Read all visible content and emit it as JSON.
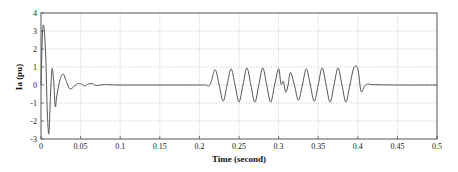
{
  "chart_data": {
    "type": "line",
    "title": "",
    "xlabel": "Time (second)",
    "ylabel": "Ia (pu)",
    "xlim": [
      0,
      0.5
    ],
    "ylim": [
      -3,
      4
    ],
    "grid": true,
    "legend": null,
    "x_ticks": [
      "0",
      "0.05",
      "0.1",
      "0.15",
      "0.2",
      "0.25",
      "0.3",
      "0.35",
      "0.4",
      "0.45",
      "0.5"
    ],
    "y_ticks": [
      "4",
      "3",
      "2",
      "1",
      "0",
      "-1",
      "-2",
      "-3"
    ],
    "series": [
      {
        "name": "Ia",
        "color": "#555555",
        "description": "Initial transient: rises to ~3.1 pu, dips to ~-2.7 pu at t~0.008, damped oscillation (peaks ~0.9, -1.2, 0.6, -0.2) settling near 0 by t~0.05; near-zero from 0.05 to 0.21; sustained ~50 Hz oscillation of amplitude ~0.9-1.0 pu from t~0.21 to t~0.40 with a disturbance dip near t~0.305; returns to ~0 after t~0.40 with small overshoot.",
        "x": [
          0,
          0.002,
          0.004,
          0.006,
          0.008,
          0.01,
          0.012,
          0.014,
          0.016,
          0.018,
          0.02,
          0.024,
          0.028,
          0.032,
          0.036,
          0.04,
          0.045,
          0.05,
          0.055,
          0.06,
          0.065,
          0.07,
          0.08,
          0.1,
          0.15,
          0.2,
          0.208,
          0.212,
          0.215,
          0.22,
          0.225,
          0.23,
          0.235,
          0.24,
          0.245,
          0.25,
          0.255,
          0.26,
          0.265,
          0.27,
          0.275,
          0.28,
          0.285,
          0.29,
          0.295,
          0.3,
          0.303,
          0.306,
          0.309,
          0.312,
          0.315,
          0.32,
          0.325,
          0.33,
          0.335,
          0.34,
          0.345,
          0.35,
          0.355,
          0.36,
          0.365,
          0.37,
          0.375,
          0.38,
          0.385,
          0.39,
          0.395,
          0.4,
          0.404,
          0.408,
          0.412,
          0.42,
          0.45,
          0.5
        ],
        "y": [
          0,
          3.0,
          3.1,
          1.5,
          -1.5,
          -2.7,
          -0.5,
          0.9,
          0.2,
          -1.2,
          -0.6,
          0.3,
          0.6,
          0.2,
          -0.2,
          -0.15,
          0.05,
          0.08,
          -0.05,
          0.06,
          0.08,
          -0.03,
          0.02,
          0,
          0,
          0,
          0,
          -0.05,
          0.2,
          0.85,
          0,
          -0.9,
          0,
          0.9,
          0,
          -0.95,
          0,
          0.95,
          0,
          -0.95,
          0,
          0.95,
          0,
          -0.95,
          0,
          0.9,
          0.05,
          0.2,
          -0.4,
          0,
          0.7,
          0,
          -0.85,
          0,
          0.9,
          0,
          -0.9,
          0,
          0.95,
          0,
          -0.95,
          0,
          0.95,
          0,
          -0.95,
          0,
          0.95,
          0.9,
          -0.35,
          -0.1,
          0.05,
          0.02,
          0,
          0
        ]
      }
    ]
  }
}
